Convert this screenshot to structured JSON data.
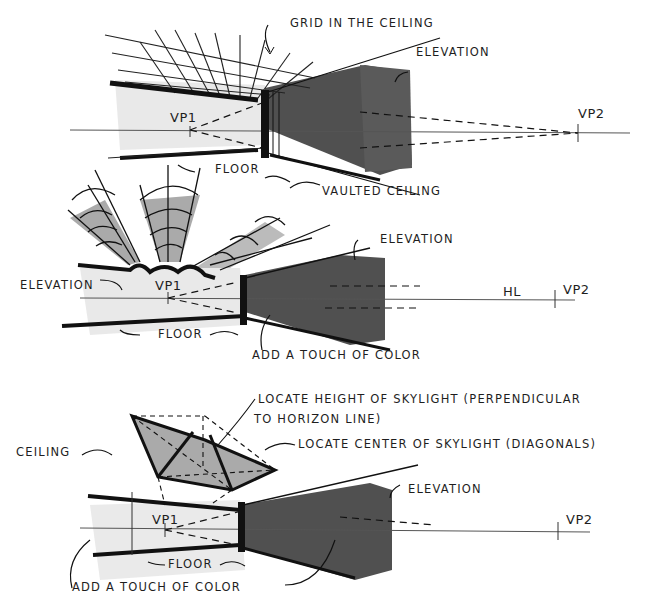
{
  "colors": {
    "ink": "#1e1e1e",
    "marker_dark": "#4a4a4a",
    "marker_mid": "#9a9a9a",
    "marker_light": "#d8d8d8",
    "background": "#ffffff"
  },
  "panels": [
    {
      "id": "grid-ceiling",
      "labels": {
        "ceiling_note": "Grid in the ceiling",
        "elevation": "Elevation",
        "vp1": "VP1",
        "vp2": "VP2",
        "floor": "Floor"
      }
    },
    {
      "id": "vaulted-ceiling",
      "labels": {
        "ceiling_note": "Vaulted ceiling",
        "elevation_right": "Elevation",
        "elevation_left": "Elevation",
        "vp1": "VP1",
        "hl": "HL",
        "vp2": "VP2",
        "floor": "Floor",
        "color_note": "Add a touch of color"
      }
    },
    {
      "id": "skylight",
      "labels": {
        "height_note_line1": "Locate height of skylight (perpendicular",
        "height_note_line2": "to horizon line)",
        "center_note": "Locate center of skylight (diagonals)",
        "ceiling": "Ceiling",
        "elevation": "Elevation",
        "vp1": "VP1",
        "vp2": "VP2",
        "floor": "Floor",
        "color_note": "Add a touch of color"
      }
    }
  ]
}
